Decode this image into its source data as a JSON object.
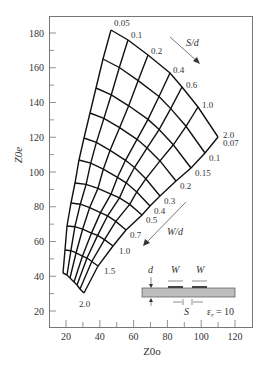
{
  "chart_data": {
    "type": "line",
    "title": "",
    "xlabel": "Z0o",
    "ylabel": "Z0e",
    "xlim": [
      10,
      130
    ],
    "ylim": [
      10,
      190
    ],
    "x_ticks": [
      20,
      40,
      60,
      80,
      100,
      120
    ],
    "y_ticks": [
      20,
      40,
      60,
      80,
      100,
      120,
      140,
      160,
      180
    ],
    "grid": false,
    "s_over_d_label": "S/d",
    "w_over_d_label": "W/d",
    "s_over_d_values": [
      "0.05",
      "0.1",
      "0.2",
      "0.4",
      "0.6",
      "1.0",
      "2.0"
    ],
    "w_over_d_values": [
      "0.07",
      "0.1",
      "0.15",
      "0.2",
      "0.3",
      "0.4",
      "0.5",
      "0.7",
      "1.0",
      "1.5",
      "2.0"
    ],
    "corners": {
      "s0.05_w0.07": {
        "Z0o": 46,
        "Z0e": 182
      },
      "s2.0_w0.07": {
        "Z0o": 109,
        "Z0e": 120
      },
      "s0.05_w2.0": {
        "Z0o": 18,
        "Z0e": 41
      },
      "s2.0_w2.0": {
        "Z0o": 31,
        "Z0e": 31
      }
    },
    "top_edge_px": [
      [
        111,
        30
      ],
      [
        128,
        40
      ],
      [
        148,
        55
      ],
      [
        170,
        73
      ],
      [
        182,
        87
      ],
      [
        198,
        107
      ],
      [
        218,
        137
      ]
    ],
    "bottom_edge_px": [
      [
        63,
        273
      ],
      [
        67,
        275
      ],
      [
        70,
        278
      ],
      [
        74,
        282
      ],
      [
        77,
        285
      ],
      [
        80,
        289
      ],
      [
        84,
        293
      ]
    ],
    "left_edge_px": [
      [
        111,
        30
      ],
      [
        103,
        59
      ],
      [
        96,
        88
      ],
      [
        90,
        113
      ],
      [
        84,
        138
      ],
      [
        79,
        160
      ],
      [
        75,
        183
      ],
      [
        71,
        203
      ],
      [
        67,
        226
      ],
      [
        65,
        250
      ],
      [
        63,
        273
      ]
    ],
    "right_edge_px": [
      [
        218,
        137
      ],
      [
        205,
        153
      ],
      [
        191,
        168
      ],
      [
        176,
        181
      ],
      [
        160,
        196
      ],
      [
        150,
        206
      ],
      [
        142,
        215
      ],
      [
        126,
        230
      ],
      [
        113,
        246
      ],
      [
        98,
        266
      ],
      [
        84,
        293
      ]
    ],
    "inset": {
      "labels": {
        "d": "d",
        "w1": "W",
        "w2": "W",
        "s": "S",
        "er": "ε",
        "er_sub": "r",
        "er_val": "= 10"
      }
    }
  }
}
